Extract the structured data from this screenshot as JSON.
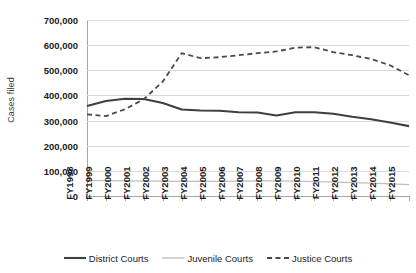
{
  "chart_data": {
    "type": "line",
    "title": "",
    "xlabel": "",
    "ylabel": "Cases filed",
    "ylim": [
      0,
      700000
    ],
    "ytick_step": 100000,
    "grid": true,
    "legend_position": "bottom",
    "categories": [
      "FY1998",
      "FY1999",
      "FY2000",
      "FY2001",
      "FY2002",
      "FY2003",
      "FY2004",
      "FY2005",
      "FY2006",
      "FY2007",
      "FY2008",
      "FY2009",
      "FY2010",
      "FY2011",
      "FY2012",
      "FY2013",
      "FY2014",
      "FY2015"
    ],
    "ytick_labels": [
      "700,000",
      "600,000",
      "500,000",
      "400,000",
      "300,000",
      "200,000",
      "100,000",
      "0"
    ],
    "ytick_values": [
      700000,
      600000,
      500000,
      400000,
      300000,
      200000,
      100000,
      0
    ],
    "series": [
      {
        "name": "District Courts",
        "style": "solid",
        "color": "#3f3f3f",
        "width": 2.1,
        "values": [
          358000,
          378000,
          387000,
          386000,
          370000,
          344000,
          340000,
          339000,
          333000,
          332000,
          320000,
          333000,
          333000,
          327000,
          315000,
          305000,
          292000,
          278000
        ]
      },
      {
        "name": "Juvenile Courts",
        "style": "solid",
        "color": "#bfbfbf",
        "width": 1.3,
        "values": [
          62000,
          61000,
          60000,
          59000,
          59000,
          58000,
          58000,
          58000,
          59000,
          60000,
          60000,
          59000,
          57000,
          55000,
          53000,
          51000,
          48000,
          45000
        ]
      },
      {
        "name": "Justice Courts",
        "style": "dashed",
        "color": "#4a4a4a",
        "width": 1.8,
        "values": [
          325000,
          318000,
          345000,
          385000,
          455000,
          568000,
          548000,
          552000,
          560000,
          568000,
          575000,
          590000,
          592000,
          572000,
          560000,
          545000,
          520000,
          480000
        ]
      }
    ]
  },
  "legend": {
    "items": [
      {
        "label": "District Courts",
        "icon": "solid-line-icon"
      },
      {
        "label": "Juvenile Courts",
        "icon": "light-line-icon"
      },
      {
        "label": "Justice Courts",
        "icon": "dashed-line-icon"
      }
    ]
  }
}
